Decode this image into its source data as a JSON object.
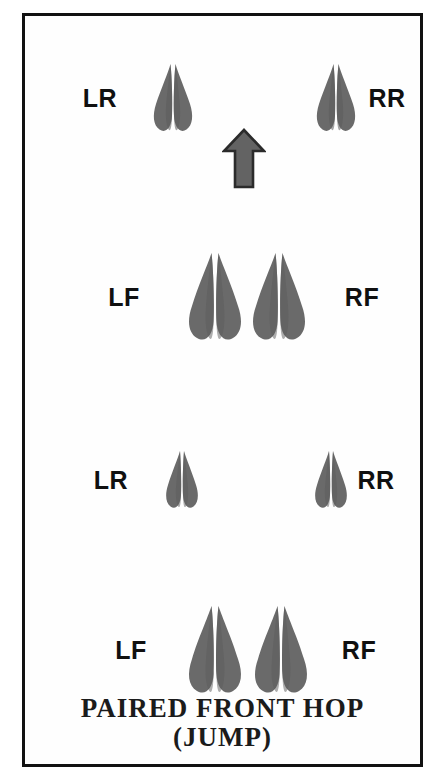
{
  "figure": {
    "title": "PAIRED FRONT HOP",
    "subtitle": "(JUMP)",
    "caption_line_1": "PAIRED FRONT HOP",
    "caption_line_2": "(JUMP)",
    "background_color": "#ffffff",
    "frame_color": "#111111",
    "track_fill_color": "#6a6a6a",
    "track_shadow_color": "#8f8f8f",
    "arrow_fill_color": "#636363",
    "arrow_outline_color": "#2b2b2b",
    "label_color": "#101010"
  },
  "direction_arrow": {
    "name": "direction-of-travel-arrow",
    "points_to": "up",
    "center_x": 219,
    "center_y": 143,
    "width": 44,
    "height": 62
  },
  "rows": [
    {
      "id": "row-1-rear",
      "type": "rear",
      "center_y": 82,
      "left_label": "LR",
      "right_label": "RR",
      "left_label_x": 75,
      "right_label_x": 362,
      "tracks": [
        {
          "name": "left-rear-track",
          "label": "LR",
          "cx": 148,
          "cy": 82,
          "size": "rear"
        },
        {
          "name": "right-rear-track",
          "label": "RR",
          "cx": 311,
          "cy": 82,
          "size": "rear"
        }
      ]
    },
    {
      "id": "row-2-front",
      "type": "front",
      "center_y": 281,
      "left_label": "LF",
      "right_label": "RF",
      "left_label_x": 99,
      "right_label_x": 337,
      "tracks": [
        {
          "name": "left-front-track",
          "label": "LF",
          "cx": 190,
          "cy": 281,
          "size": "front"
        },
        {
          "name": "right-front-track",
          "label": "RF",
          "cx": 254,
          "cy": 281,
          "size": "front"
        }
      ]
    },
    {
      "id": "row-3-rear",
      "type": "rear",
      "center_y": 464,
      "left_label": "LR",
      "right_label": "RR",
      "left_label_x": 86,
      "right_label_x": 351,
      "tracks": [
        {
          "name": "left-rear-track",
          "label": "LR",
          "cx": 157,
          "cy": 464,
          "size": "rear-small"
        },
        {
          "name": "right-rear-track",
          "label": "RR",
          "cx": 306,
          "cy": 464,
          "size": "rear-small"
        }
      ]
    },
    {
      "id": "row-4-front",
      "type": "front",
      "center_y": 634,
      "left_label": "LF",
      "right_label": "RF",
      "left_label_x": 106,
      "right_label_x": 334,
      "tracks": [
        {
          "name": "left-front-track",
          "label": "LF",
          "cx": 190,
          "cy": 634,
          "size": "front"
        },
        {
          "name": "right-front-track",
          "label": "RF",
          "cx": 256,
          "cy": 634,
          "size": "front"
        }
      ]
    }
  ],
  "caption": {
    "top": 678,
    "line_1": "PAIRED FRONT HOP",
    "line_2": "(JUMP)"
  },
  "legend_terms": {
    "LR": "Left Rear",
    "RR": "Right Rear",
    "LF": "Left Front",
    "RF": "Right Front"
  }
}
